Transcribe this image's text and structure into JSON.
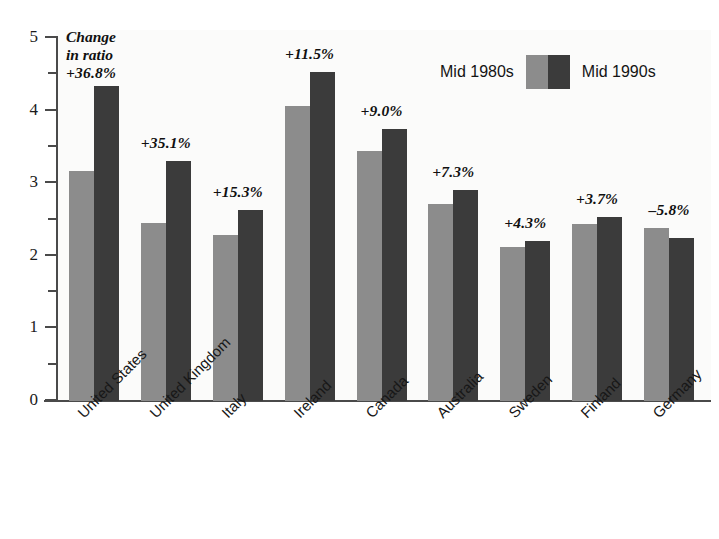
{
  "chart_data": {
    "type": "bar",
    "title": "",
    "xlabel": "",
    "ylabel": "",
    "ylim": [
      0,
      5
    ],
    "y_ticks": [
      "0",
      "1",
      "2",
      "3",
      "4",
      "5"
    ],
    "y_minor_ticks": [
      0.5,
      1.5,
      2.5,
      3.5,
      4.5
    ],
    "grid": false,
    "legend_position": "top-right",
    "categories": [
      "United States",
      "United Kingdom",
      "Italy",
      "Ireland",
      "Canada",
      "Australia",
      "Sweden",
      "Finland",
      "Germany"
    ],
    "series": [
      {
        "name": "Mid 1980s",
        "color": "#8c8c8c",
        "values": [
          3.17,
          2.45,
          2.28,
          4.06,
          3.44,
          2.71,
          2.12,
          2.44,
          2.38
        ]
      },
      {
        "name": "Mid 1990s",
        "color": "#3b3b3b",
        "values": [
          4.34,
          3.31,
          2.63,
          4.53,
          3.75,
          2.91,
          2.21,
          2.53,
          2.24
        ]
      }
    ],
    "annotations": {
      "caption_lines": [
        "Change",
        "in ratio"
      ],
      "per_category_change": [
        "+36.8%",
        "+35.1%",
        "+15.3%",
        "+11.5%",
        "+9.0%",
        "+7.3%",
        "+4.3%",
        "+3.7%",
        "–5.8%"
      ]
    }
  },
  "legend": {
    "left_label": "Mid 1980s",
    "right_label": "Mid 1990s",
    "left_color": "#8c8c8c",
    "right_color": "#3b3b3b"
  },
  "axis": {
    "y_labels": [
      "5",
      "4",
      "3",
      "2",
      "1",
      "0"
    ]
  },
  "caption": {
    "line1": "Change",
    "line2": "in ratio"
  },
  "colors": {
    "light_bar": "#8c8c8c",
    "dark_bar": "#3b3b3b",
    "axis": "#4a4a4a",
    "text": "#141414",
    "background": "#ffffff"
  }
}
